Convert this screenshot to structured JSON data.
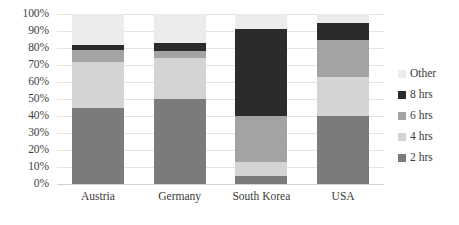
{
  "chart_data": {
    "type": "bar",
    "subtype": "stacked-100-percent",
    "title": "",
    "xlabel": "",
    "ylabel": "",
    "ylim": [
      0,
      100
    ],
    "yticks": [
      "0%",
      "10%",
      "20%",
      "30%",
      "40%",
      "50%",
      "60%",
      "70%",
      "80%",
      "90%",
      "100%"
    ],
    "ytick_values": [
      0,
      10,
      20,
      30,
      40,
      50,
      60,
      70,
      80,
      90,
      100
    ],
    "grid": true,
    "legend_position": "right",
    "categories": [
      "Austria",
      "Germany",
      "South Korea",
      "USA"
    ],
    "series": [
      {
        "name": "2 hrs",
        "color": "#7b7b7b",
        "values": [
          45,
          50,
          5,
          40
        ]
      },
      {
        "name": "4 hrs",
        "color": "#d4d4d4",
        "values": [
          27,
          24,
          8,
          23
        ]
      },
      {
        "name": "6 hrs",
        "color": "#a3a3a3",
        "values": [
          7,
          4,
          27,
          22
        ]
      },
      {
        "name": "8 hrs",
        "color": "#2b2b2b",
        "values": [
          3,
          5,
          51,
          10
        ]
      },
      {
        "name": "Other",
        "color": "#ececec",
        "values": [
          18,
          17,
          9,
          5
        ]
      }
    ],
    "legend_order": [
      "Other",
      "8 hrs",
      "6 hrs",
      "4 hrs",
      "2 hrs"
    ],
    "annotations": []
  },
  "colors": {
    "gridline": "#e3e3e3",
    "axis_text": "#3a3a3a",
    "background": "#ffffff"
  }
}
